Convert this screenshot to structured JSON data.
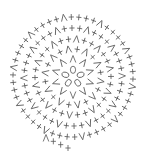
{
  "diagram": {
    "type": "crochet-round-chart",
    "center": [
      73,
      77
    ],
    "stroke_color": "#555555",
    "background": "#ffffff",
    "legend_symbols": {
      "+": "single-crochet",
      "V": "increase",
      "O": "chain-loop"
    },
    "center_loops": {
      "symbol": "O",
      "count": 5,
      "radius": 8
    },
    "rings": [
      {
        "radius": 18,
        "pattern": "V",
        "count": 10
      },
      {
        "radius": 28,
        "pattern": "+V",
        "count": 10
      },
      {
        "radius": 38,
        "pattern": "++V",
        "count": 10
      },
      {
        "radius": 49,
        "pattern": "+++V",
        "count": 10
      },
      {
        "radius": 60,
        "pattern": "++++V",
        "count": 10
      }
    ],
    "tail": {
      "symbols": "V+++",
      "from": [
        46,
        138
      ],
      "to": [
        68,
        148
      ]
    }
  }
}
